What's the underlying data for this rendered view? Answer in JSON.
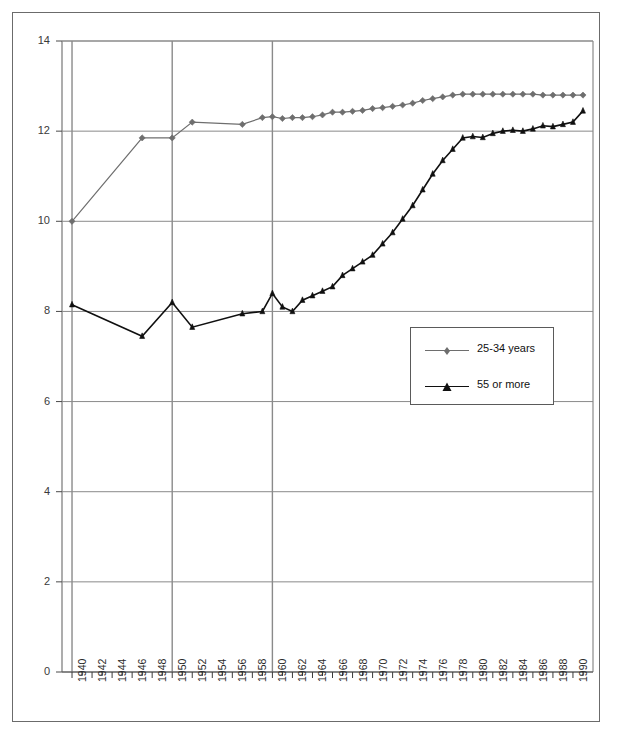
{
  "chart_data": {
    "type": "line",
    "title": "",
    "xlabel": "",
    "ylabel": "",
    "xlim": [
      1939,
      1992
    ],
    "ylim": [
      0,
      14
    ],
    "y_ticks": [
      0,
      2,
      4,
      6,
      8,
      10,
      12,
      14
    ],
    "x_tick_labels": [
      "1940",
      "1942",
      "1944",
      "1946",
      "1948",
      "1950",
      "1952",
      "1954",
      "1956",
      "1958",
      "1960",
      "1962",
      "1964",
      "1966",
      "1968",
      "1970",
      "1972",
      "1974",
      "1976",
      "1978",
      "1980",
      "1982",
      "1984",
      "1986",
      "1988",
      "1990"
    ],
    "x_tick_values": [
      1940,
      1942,
      1944,
      1946,
      1948,
      1950,
      1952,
      1954,
      1956,
      1958,
      1960,
      1962,
      1964,
      1966,
      1968,
      1970,
      1972,
      1974,
      1976,
      1978,
      1980,
      1982,
      1984,
      1986,
      1988,
      1990
    ],
    "x_minor_ticks_every": 1,
    "grid": {
      "horizontal": true,
      "vertical": true,
      "vertical_every": 10,
      "vertical_at": [
        1940,
        1950,
        1960
      ]
    },
    "legend": {
      "position": "inside-right-middle",
      "entries": [
        "25-34 years",
        "55 or more"
      ]
    },
    "colors": {
      "series_1": "#6e6e6e",
      "series_2": "#101010",
      "grid": "#8a8a8a",
      "frame": "#6b6b6b",
      "axis_text": "#2b2b2b"
    },
    "markers": {
      "series_1": "diamond",
      "series_2": "triangle"
    },
    "series": [
      {
        "name": "25-34 years",
        "marker": "diamond",
        "color": "#6e6e6e",
        "points": [
          [
            1940,
            10.0
          ],
          [
            1947,
            11.85
          ],
          [
            1950,
            11.85
          ],
          [
            1952,
            12.2
          ],
          [
            1957,
            12.15
          ],
          [
            1959,
            12.3
          ],
          [
            1960,
            12.32
          ],
          [
            1961,
            12.28
          ],
          [
            1962,
            12.3
          ],
          [
            1963,
            12.3
          ],
          [
            1964,
            12.32
          ],
          [
            1965,
            12.36
          ],
          [
            1966,
            12.42
          ],
          [
            1967,
            12.42
          ],
          [
            1968,
            12.44
          ],
          [
            1969,
            12.46
          ],
          [
            1970,
            12.5
          ],
          [
            1971,
            12.52
          ],
          [
            1972,
            12.55
          ],
          [
            1973,
            12.58
          ],
          [
            1974,
            12.62
          ],
          [
            1975,
            12.68
          ],
          [
            1976,
            12.72
          ],
          [
            1977,
            12.76
          ],
          [
            1978,
            12.8
          ],
          [
            1979,
            12.82
          ],
          [
            1980,
            12.82
          ],
          [
            1981,
            12.82
          ],
          [
            1982,
            12.82
          ],
          [
            1983,
            12.82
          ],
          [
            1984,
            12.82
          ],
          [
            1985,
            12.82
          ],
          [
            1986,
            12.82
          ],
          [
            1987,
            12.8
          ],
          [
            1988,
            12.8
          ],
          [
            1989,
            12.8
          ],
          [
            1990,
            12.8
          ],
          [
            1991,
            12.8
          ]
        ]
      },
      {
        "name": "55 or more",
        "marker": "triangle",
        "color": "#101010",
        "points": [
          [
            1940,
            8.15
          ],
          [
            1947,
            7.45
          ],
          [
            1950,
            8.2
          ],
          [
            1952,
            7.65
          ],
          [
            1957,
            7.95
          ],
          [
            1959,
            8.0
          ],
          [
            1960,
            8.4
          ],
          [
            1961,
            8.1
          ],
          [
            1962,
            8.0
          ],
          [
            1963,
            8.25
          ],
          [
            1964,
            8.35
          ],
          [
            1965,
            8.45
          ],
          [
            1966,
            8.55
          ],
          [
            1967,
            8.8
          ],
          [
            1968,
            8.95
          ],
          [
            1969,
            9.1
          ],
          [
            1970,
            9.25
          ],
          [
            1971,
            9.5
          ],
          [
            1972,
            9.75
          ],
          [
            1973,
            10.05
          ],
          [
            1974,
            10.35
          ],
          [
            1975,
            10.7
          ],
          [
            1976,
            11.05
          ],
          [
            1977,
            11.35
          ],
          [
            1978,
            11.6
          ],
          [
            1979,
            11.85
          ],
          [
            1980,
            11.88
          ],
          [
            1981,
            11.86
          ],
          [
            1982,
            11.95
          ],
          [
            1983,
            12.0
          ],
          [
            1984,
            12.02
          ],
          [
            1985,
            12.0
          ],
          [
            1986,
            12.05
          ],
          [
            1987,
            12.12
          ],
          [
            1988,
            12.1
          ],
          [
            1989,
            12.15
          ],
          [
            1990,
            12.2
          ],
          [
            1991,
            12.45
          ]
        ]
      }
    ]
  },
  "axes": {
    "y_labels": [
      "14",
      "12",
      "10",
      "8",
      "6",
      "4",
      "2",
      "0"
    ]
  },
  "legend": {
    "items": [
      {
        "label": "25-34 years",
        "marker": "diamond",
        "color": "#6e6e6e"
      },
      {
        "label": "55 or more",
        "marker": "triangle",
        "color": "#101010"
      }
    ]
  }
}
